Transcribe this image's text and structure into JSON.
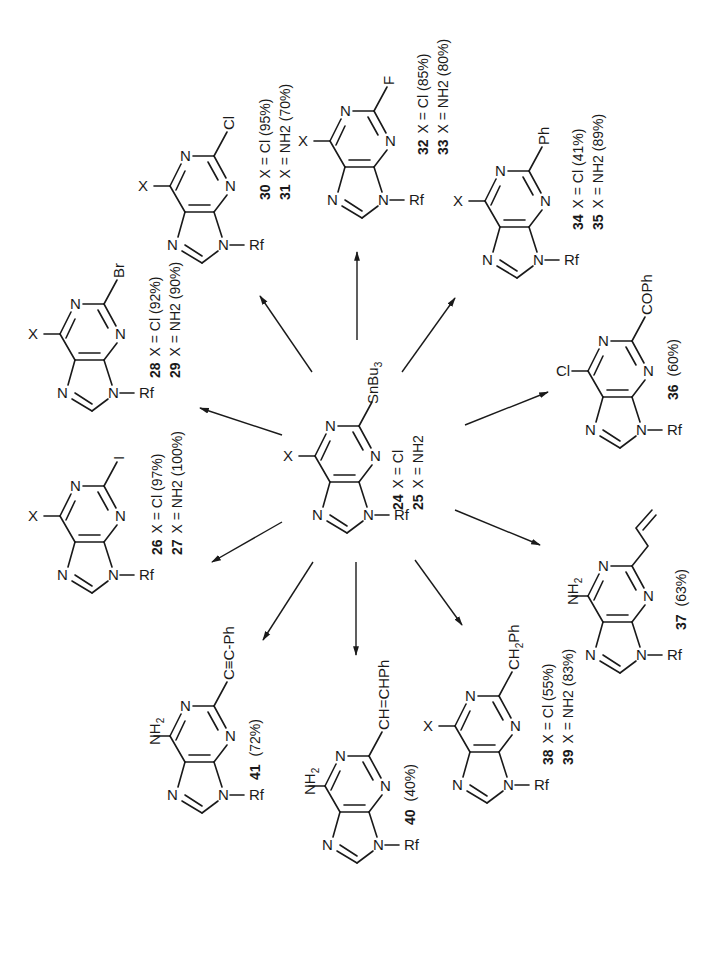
{
  "scheme": {
    "center": {
      "id": "24_25",
      "c6": "X",
      "c2": "SnBu3",
      "n9": "Rf",
      "lines": [
        {
          "num": "24",
          "text": "X = Cl"
        },
        {
          "num": "25",
          "text": "X = NH2"
        }
      ]
    },
    "products": [
      {
        "id": "26_27",
        "c6": "X",
        "c2": "I",
        "n9": "Rf",
        "lines": [
          {
            "num": "26",
            "text": "X = Cl (97%)"
          },
          {
            "num": "27",
            "text": "X = NH2 (100%)"
          }
        ]
      },
      {
        "id": "28_29",
        "c6": "X",
        "c2": "Br",
        "n9": "Rf",
        "lines": [
          {
            "num": "28",
            "text": "X = Cl (92%)"
          },
          {
            "num": "29",
            "text": "X = NH2 (90%)"
          }
        ]
      },
      {
        "id": "30_31",
        "c6": "X",
        "c2": "Cl",
        "n9": "Rf",
        "lines": [
          {
            "num": "30",
            "text": "X = Cl (95%)"
          },
          {
            "num": "31",
            "text": "X = NH2 (70%)"
          }
        ]
      },
      {
        "id": "32_33",
        "c6": "X",
        "c2": "F",
        "n9": "Rf",
        "lines": [
          {
            "num": "32",
            "text": "X = Cl (85%)"
          },
          {
            "num": "33",
            "text": "X = NH2 (80%)"
          }
        ]
      },
      {
        "id": "34_35",
        "c6": "X",
        "c2": "Ph",
        "n9": "Rf",
        "lines": [
          {
            "num": "34",
            "text": "X = Cl (41%)"
          },
          {
            "num": "35",
            "text": "X = NH2 (89%)"
          }
        ]
      },
      {
        "id": "36",
        "c6": "Cl",
        "c2": "COPh",
        "n9": "Rf",
        "lines": [
          {
            "num": "36",
            "text": "(60%)"
          }
        ]
      },
      {
        "id": "37",
        "c6": "NH2",
        "c2": "allyl",
        "n9": "Rf",
        "lines": [
          {
            "num": "37",
            "text": "(63%)"
          }
        ]
      },
      {
        "id": "38_39",
        "c6": "X",
        "c2": "CH2Ph",
        "n9": "Rf",
        "lines": [
          {
            "num": "38",
            "text": "X = Cl (55%)"
          },
          {
            "num": "39",
            "text": "X = NH2 (83%)"
          }
        ]
      },
      {
        "id": "40",
        "c6": "NH2",
        "c2": "CH=CHPh",
        "n9": "Rf",
        "lines": [
          {
            "num": "40",
            "text": "(40%)"
          }
        ]
      },
      {
        "id": "41",
        "c6": "NH2",
        "c2": "C≡C-Ph",
        "n9": "Rf",
        "lines": [
          {
            "num": "41",
            "text": "(72%)"
          }
        ]
      }
    ],
    "ring_atoms": {
      "n": "N"
    },
    "subscripts": {
      "nh2_main": "NH",
      "nh2_sub": "2",
      "sn_main": "SnBu",
      "sn_sub": "3",
      "ch2_a": "CH",
      "ch2_sub": "2",
      "ch2_b": "Ph"
    }
  }
}
